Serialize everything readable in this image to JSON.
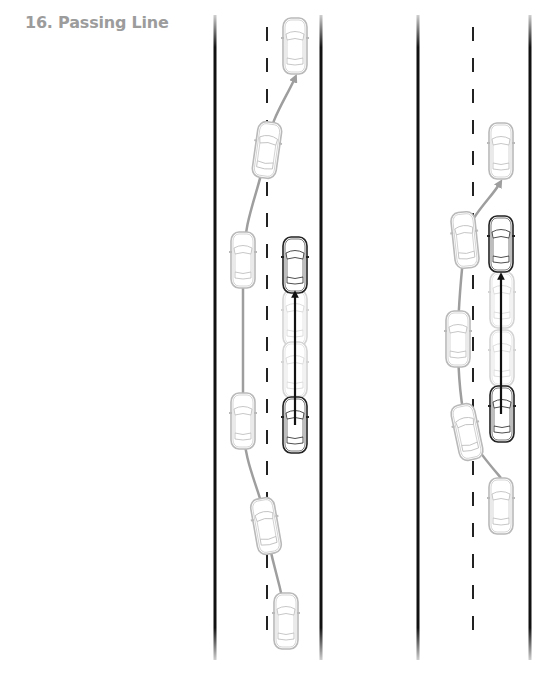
{
  "title": "16. Passing Line",
  "colors": {
    "road_edge": "#111111",
    "lane_dash": "#222222",
    "path_gray": "#9e9e9e",
    "path_dark": "#111111",
    "car_gray": "#b9b9b9",
    "car_ghost": "#d4d4d4",
    "car_dark": "#222222"
  },
  "diagrams": [
    {
      "name": "incorrect-passing",
      "road": {
        "left_x": 215,
        "right_x": 321,
        "dash_x": 267,
        "top": 15,
        "bottom": 660
      },
      "passing_path": "M286,620 C282,585 270,560 266,525 C262,490 244,470 243,422 L243,262 C244,215 262,185 266,150 C270,120 285,100 295,78",
      "straight_path": {
        "x": 295,
        "y1": 425,
        "y2": 290
      },
      "cars": [
        {
          "kind": "gray",
          "cx": 295,
          "cy": 46,
          "rot": 0
        },
        {
          "kind": "gray",
          "cx": 267,
          "cy": 150,
          "rot": 8
        },
        {
          "kind": "gray",
          "cx": 243,
          "cy": 260,
          "rot": 0
        },
        {
          "kind": "gray",
          "cx": 243,
          "cy": 421,
          "rot": 0
        },
        {
          "kind": "gray",
          "cx": 266,
          "cy": 526,
          "rot": -10
        },
        {
          "kind": "gray",
          "cx": 286,
          "cy": 621,
          "rot": 0
        },
        {
          "kind": "ghost",
          "cx": 295,
          "cy": 318,
          "rot": 0
        },
        {
          "kind": "ghost",
          "cx": 295,
          "cy": 370,
          "rot": 0
        },
        {
          "kind": "dark",
          "cx": 295,
          "cy": 265,
          "rot": 0
        },
        {
          "kind": "dark",
          "cx": 295,
          "cy": 425,
          "rot": 0
        }
      ]
    },
    {
      "name": "correct-passing",
      "road": {
        "left_x": 418,
        "right_x": 530,
        "dash_x": 473,
        "top": 15,
        "bottom": 660
      },
      "passing_path": "M501,478 C490,465 475,448 467,430 C462,410 458,385 458,340 C458,300 462,270 465,240 C470,215 490,200 500,183",
      "straight_path": {
        "x": 501,
        "y1": 414,
        "y2": 272
      },
      "cars": [
        {
          "kind": "gray",
          "cx": 501,
          "cy": 151,
          "rot": 0
        },
        {
          "kind": "gray",
          "cx": 465,
          "cy": 240,
          "rot": -6
        },
        {
          "kind": "gray",
          "cx": 458,
          "cy": 339,
          "rot": 0
        },
        {
          "kind": "gray",
          "cx": 467,
          "cy": 432,
          "rot": -12
        },
        {
          "kind": "gray",
          "cx": 501,
          "cy": 506,
          "rot": 0
        },
        {
          "kind": "ghost",
          "cx": 502,
          "cy": 300,
          "rot": 0
        },
        {
          "kind": "ghost",
          "cx": 502,
          "cy": 358,
          "rot": 0
        },
        {
          "kind": "dark",
          "cx": 501,
          "cy": 244,
          "rot": 0
        },
        {
          "kind": "dark",
          "cx": 502,
          "cy": 414,
          "rot": 0
        }
      ]
    }
  ]
}
